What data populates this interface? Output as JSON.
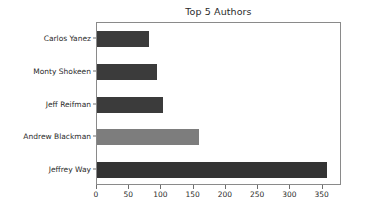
{
  "chart_data": {
    "type": "bar",
    "orientation": "horizontal",
    "title": "Top 5 Authors",
    "xlabel": "",
    "ylabel": "",
    "categories": [
      "Jeffrey Way",
      "Andrew Blackman",
      "Jeff Reifman",
      "Monty Shokeen",
      "Carlos Yanez"
    ],
    "values": [
      357,
      158,
      103,
      93,
      80
    ],
    "xlim": [
      0,
      380
    ],
    "xticks": [
      0,
      50,
      100,
      150,
      200,
      250,
      300,
      350
    ],
    "xtick_labels": [
      "0",
      "50",
      "100",
      "150",
      "200",
      "250",
      "300",
      "350"
    ],
    "ytick_labels": [
      "Carlos Yanez",
      "Monty Shokeen",
      "Jeff Reifman",
      "Andrew Blackman",
      "Jeffrey Way"
    ],
    "grid": false,
    "legend": null,
    "bar_colors": [
      "#333333",
      "#7d7d7d",
      "#3b3b3b",
      "#3b3b3b",
      "#3b3b3b"
    ],
    "bars": [
      {
        "label": "Carlos Yanez",
        "value": 80,
        "color": "#3b3b3b"
      },
      {
        "label": "Monty Shokeen",
        "value": 93,
        "color": "#3b3b3b"
      },
      {
        "label": "Jeff Reifman",
        "value": 103,
        "color": "#3b3b3b"
      },
      {
        "label": "Andrew Blackman",
        "value": 158,
        "color": "#7d7d7d"
      },
      {
        "label": "Jeffrey Way",
        "value": 357,
        "color": "#333333"
      }
    ]
  },
  "figure": {
    "background_color": "#ffffff",
    "axes_edge_color": "#8a8a8a",
    "tick_color": "#6e6e6e",
    "text_color": "#2b2b2b"
  }
}
